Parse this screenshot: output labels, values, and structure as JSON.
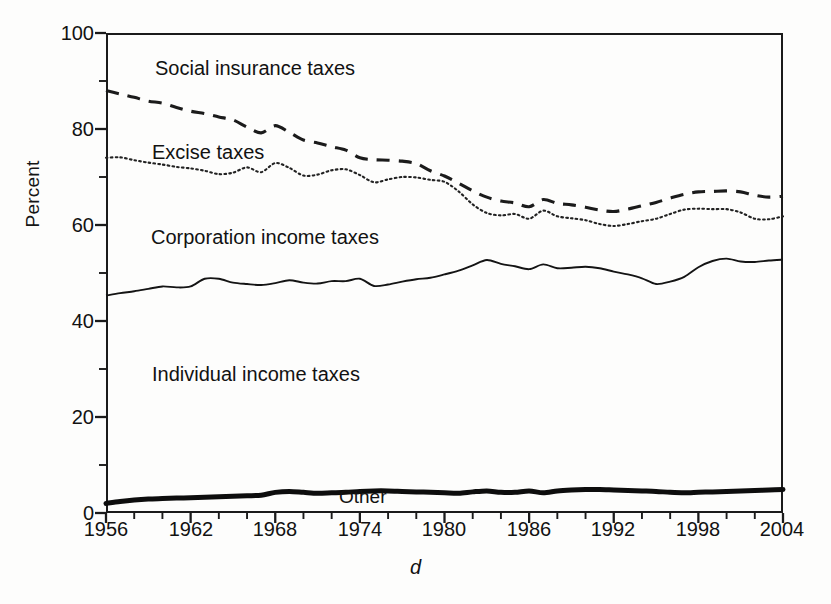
{
  "figure": {
    "background_color": "#fdfdfc",
    "ink_color": "#1b1b1b"
  },
  "axes": {
    "y_axis_title": "Percent",
    "x_axis_title": "d",
    "y_ticks": [
      "0",
      "20",
      "40",
      "60",
      "80",
      "100"
    ],
    "x_ticks": [
      "1956",
      "1962",
      "1968",
      "1974",
      "1980",
      "1986",
      "1992",
      "1998",
      "2004"
    ]
  },
  "band_labels": {
    "social_insurance": "Social insurance taxes",
    "excise": "Excise taxes",
    "corporation": "Corporation income taxes",
    "individual": "Individual income taxes",
    "other": "Other"
  },
  "chart_data": {
    "type": "area",
    "title": "",
    "subtitle": "",
    "xlabel": "d",
    "ylabel": "Percent",
    "xlim": [
      1956,
      2004
    ],
    "ylim": [
      0,
      100
    ],
    "y_major_ticks": [
      0,
      20,
      40,
      60,
      80,
      100
    ],
    "y_minor_tick_interval": 10,
    "x_tick_labels": [
      1956,
      1962,
      1968,
      1974,
      1980,
      1986,
      1992,
      1998,
      2004
    ],
    "x_minor_tick_interval": 2,
    "grid": false,
    "legend_position": "inline-band-labels",
    "stacked": true,
    "note": "Values are cumulative stacked boundary percentages read off the plotted curves; each boundary curve is the running total of shares from the bottom up.",
    "x": [
      1956,
      1957,
      1958,
      1959,
      1960,
      1961,
      1962,
      1963,
      1964,
      1965,
      1966,
      1967,
      1968,
      1969,
      1970,
      1971,
      1972,
      1973,
      1974,
      1975,
      1976,
      1977,
      1978,
      1979,
      1980,
      1981,
      1982,
      1983,
      1984,
      1985,
      1986,
      1987,
      1988,
      1989,
      1990,
      1991,
      1992,
      1993,
      1994,
      1995,
      1996,
      1997,
      1998,
      1999,
      2000,
      2001,
      2002,
      2003,
      2004
    ],
    "boundaries": [
      {
        "name": "Other",
        "line_style": "solid-thick",
        "description": "top of the Other band (bottom-most band)",
        "values": [
          2.0,
          2.4,
          2.7,
          2.9,
          3.0,
          3.1,
          3.2,
          3.3,
          3.4,
          3.5,
          3.6,
          3.7,
          4.3,
          4.5,
          4.3,
          4.1,
          4.2,
          4.3,
          4.5,
          4.6,
          4.6,
          4.5,
          4.4,
          4.3,
          4.2,
          4.1,
          4.4,
          4.6,
          4.3,
          4.3,
          4.6,
          4.2,
          4.6,
          4.8,
          4.9,
          4.9,
          4.8,
          4.7,
          4.6,
          4.5,
          4.3,
          4.2,
          4.3,
          4.4,
          4.5,
          4.6,
          4.7,
          4.8,
          4.9
        ]
      },
      {
        "name": "Individual income taxes",
        "line_style": "solid-thin",
        "description": "top of the Individual income taxes band",
        "values": [
          45.3,
          45.8,
          46.2,
          46.7,
          47.2,
          47.0,
          47.2,
          48.8,
          48.8,
          48.0,
          47.7,
          47.5,
          47.9,
          48.5,
          48.0,
          47.8,
          48.3,
          48.3,
          48.8,
          47.3,
          47.6,
          48.2,
          48.7,
          49.0,
          49.7,
          50.5,
          51.6,
          52.7,
          51.9,
          51.4,
          50.8,
          51.8,
          51.0,
          51.1,
          51.3,
          51.0,
          50.3,
          49.7,
          48.9,
          47.7,
          48.2,
          49.2,
          51.2,
          52.5,
          53.0,
          52.4,
          52.3,
          52.6,
          52.8
        ]
      },
      {
        "name": "Corporation income taxes",
        "line_style": "dotted",
        "description": "top of the Corporation income taxes band (= bottom of Excise band)",
        "values": [
          74.0,
          74.1,
          73.5,
          73.0,
          72.6,
          72.1,
          71.8,
          71.3,
          70.6,
          70.9,
          72.0,
          71.0,
          72.9,
          71.9,
          70.3,
          70.5,
          71.4,
          71.6,
          70.4,
          68.9,
          69.5,
          70.0,
          69.9,
          69.4,
          69.0,
          67.0,
          64.3,
          62.5,
          62.0,
          62.3,
          61.3,
          63.0,
          61.8,
          61.4,
          61.0,
          60.2,
          59.8,
          60.2,
          60.8,
          61.3,
          62.3,
          63.2,
          63.4,
          63.3,
          63.3,
          62.6,
          61.3,
          61.2,
          61.8
        ]
      },
      {
        "name": "Excise taxes",
        "line_style": "dashed",
        "description": "top of the Excise taxes band (= bottom of Social insurance band)",
        "values": [
          88.0,
          87.3,
          86.6,
          85.8,
          85.4,
          84.5,
          83.7,
          83.2,
          82.5,
          81.9,
          80.4,
          79.2,
          80.7,
          79.3,
          77.7,
          77.1,
          76.3,
          75.6,
          74.0,
          73.6,
          73.5,
          73.3,
          72.8,
          71.3,
          70.2,
          68.7,
          67.1,
          65.8,
          65.0,
          64.6,
          63.8,
          65.3,
          64.5,
          64.2,
          63.7,
          63.1,
          62.8,
          63.3,
          64.0,
          64.7,
          65.6,
          66.4,
          66.9,
          67.0,
          67.1,
          66.9,
          66.2,
          65.8,
          66.0
        ]
      },
      {
        "name": "Social insurance taxes",
        "line_style": "frame-top",
        "description": "top of the Social insurance taxes band = 100 percent total",
        "values": [
          100,
          100,
          100,
          100,
          100,
          100,
          100,
          100,
          100,
          100,
          100,
          100,
          100,
          100,
          100,
          100,
          100,
          100,
          100,
          100,
          100,
          100,
          100,
          100,
          100,
          100,
          100,
          100,
          100,
          100,
          100,
          100,
          100,
          100,
          100,
          100,
          100,
          100,
          100,
          100,
          100,
          100,
          100,
          100,
          100,
          100,
          100,
          100,
          100
        ]
      }
    ]
  }
}
